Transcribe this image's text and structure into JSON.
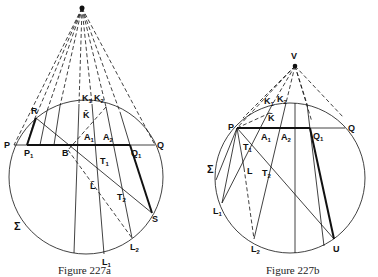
{
  "figures": [
    {
      "id": "fig227a",
      "caption": "Figure 227a",
      "labels": {
        "P": "P",
        "Q": "Q",
        "P1": "P",
        "P1_sub": "1",
        "Q1": "Q",
        "Q1_sub": "1",
        "R": "R",
        "B": "B",
        "K1": "K",
        "K1_sub": "1",
        "K2": "K",
        "K2_sub": "2",
        "Kbar": "K̄",
        "A1": "A",
        "A1_sub": "1",
        "A2": "A",
        "A2_sub": "2",
        "T1": "T",
        "T1_sub": "1",
        "T2": "T",
        "T2_sub": "2",
        "Lbar": "L̄",
        "S": "S",
        "L1": "L",
        "L1_sub": "1",
        "L2": "L",
        "L2_sub": "2",
        "Sigma": "Σ"
      }
    },
    {
      "id": "fig227b",
      "caption": "Figure 227b",
      "labels": {
        "V": "V",
        "P": "P",
        "Q": "Q",
        "Q1": "Q",
        "Q1_sub": "1",
        "K1": "K",
        "K1_sub": "1",
        "K2": "K",
        "K2_sub": "2",
        "Kbar": "K̄",
        "A1": "A",
        "A1_sub": "1",
        "A2": "A",
        "A2_sub": "2",
        "T1": "T",
        "T1_sub": "1",
        "T2": "T",
        "T2_sub": "2",
        "L": "L",
        "L1": "L",
        "L1_sub": "1",
        "L2": "L",
        "L2_sub": "2",
        "U": "U",
        "Sigma": "Σ"
      }
    }
  ]
}
